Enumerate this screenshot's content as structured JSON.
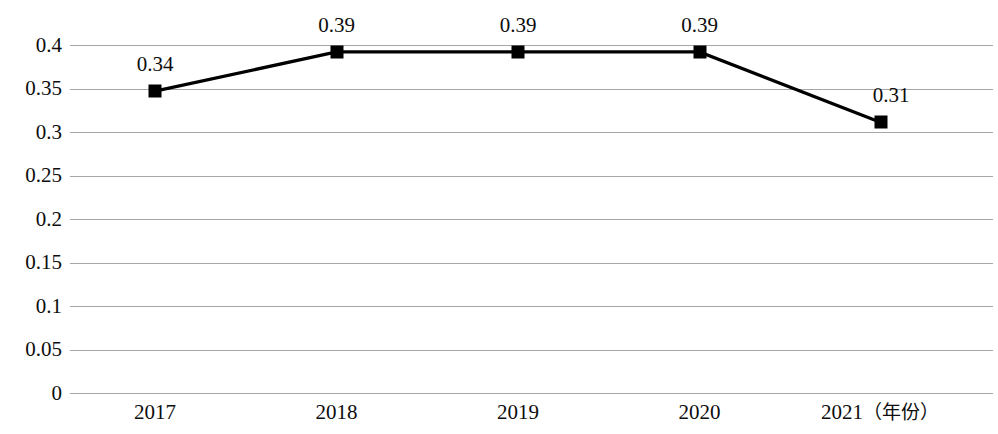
{
  "chart_data": {
    "type": "line",
    "title": "",
    "subtitle": "",
    "xlabel": "（年份）",
    "ylabel": "",
    "categories": [
      "2017",
      "2018",
      "2019",
      "2020",
      "2021"
    ],
    "values": [
      0.34,
      0.39,
      0.39,
      0.39,
      0.31
    ],
    "plotted_values": [
      0.347,
      0.392,
      0.392,
      0.392,
      0.311
    ],
    "data_labels": [
      "0.34",
      "0.39",
      "0.39",
      "0.39",
      "0.31"
    ],
    "ylim": [
      0,
      0.4
    ],
    "xlim_categories": 5,
    "y_ticks": [
      0,
      0.05,
      0.1,
      0.15,
      0.2,
      0.25,
      0.3,
      0.35,
      0.4
    ],
    "y_tick_labels": [
      "0",
      "0.05",
      "0.1",
      "0.15",
      "0.2",
      "0.25",
      "0.3",
      "0.35",
      "0.4"
    ],
    "grid": true,
    "grid_orientation": "horizontal",
    "legend": false,
    "legend_position": "none",
    "marker": "square",
    "marker_color": "#000000",
    "line_color": "#000000",
    "grid_color": "#a6a6a6",
    "background_color": "#ffffff",
    "text_color": "#0d0d0d"
  },
  "axis": {
    "x_labels": [
      {
        "text": "2017",
        "unit": ""
      },
      {
        "text": "2018",
        "unit": ""
      },
      {
        "text": "2019",
        "unit": ""
      },
      {
        "text": "2020",
        "unit": ""
      },
      {
        "text": "2021",
        "unit": "（年份）"
      }
    ]
  }
}
